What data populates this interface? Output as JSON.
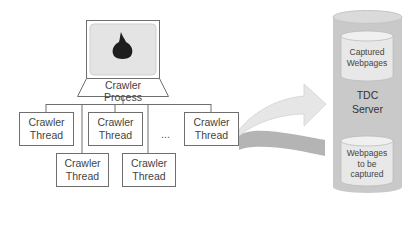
{
  "diagram": {
    "crawler_process": {
      "icon": "tor-onion-icon",
      "line1": "Crawler",
      "line2": "Process"
    },
    "threads_top": [
      {
        "line1": "Crawler",
        "line2": "Thread"
      },
      {
        "line1": "Crawler",
        "line2": "Thread"
      },
      {
        "line1": "Crawler",
        "line2": "Thread"
      }
    ],
    "threads_bottom": [
      {
        "line1": "Crawler",
        "line2": "Thread"
      },
      {
        "line1": "Crawler",
        "line2": "Thread"
      }
    ],
    "ellipsis": "...",
    "server": {
      "line1": "TDC",
      "line2": "Server",
      "stores": [
        {
          "lines": [
            "Captured",
            "Webpages"
          ]
        },
        {
          "lines": [
            "Webpages",
            "to be",
            "captured"
          ]
        }
      ]
    },
    "colors": {
      "line": "#6e6e6e",
      "screen_bg": "#e4e4e4",
      "cylinder_outer": "#c9c9c9",
      "cylinder_outer_top": "#dadada",
      "cylinder_inner": "#e8e8e8",
      "arrow_light": "#e6e6e6",
      "arrow_dark": "#b4b4b4"
    }
  }
}
